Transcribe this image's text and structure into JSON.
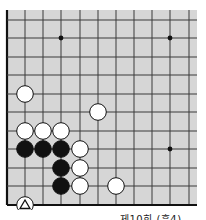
{
  "diagram": {
    "type": "go-board-fragment",
    "colors": {
      "board": "#d6d6d6",
      "line": "#3a3a3a",
      "edge": "#111111",
      "black": "#111111",
      "white": "#ffffff"
    },
    "grid": {
      "cols_x": [
        7,
        25,
        43,
        61,
        80,
        98,
        116,
        134,
        152,
        170,
        189
      ],
      "rows_y": [
        20,
        38,
        57,
        75,
        94,
        112,
        131,
        149,
        168,
        186,
        205
      ],
      "board_rect": {
        "x": 7,
        "y": 10,
        "w": 190,
        "h": 195
      },
      "edges": [
        "left",
        "bottom"
      ]
    },
    "star_points": [
      [
        3,
        1
      ],
      [
        9,
        1
      ],
      [
        9,
        7
      ]
    ],
    "stones": [
      {
        "color": "white",
        "col": 1,
        "row": 4
      },
      {
        "color": "white",
        "col": 5,
        "row": 5
      },
      {
        "color": "white",
        "col": 1,
        "row": 6
      },
      {
        "color": "white",
        "col": 2,
        "row": 6
      },
      {
        "color": "white",
        "col": 3,
        "row": 6
      },
      {
        "color": "black",
        "col": 1,
        "row": 7
      },
      {
        "color": "black",
        "col": 2,
        "row": 7
      },
      {
        "color": "black",
        "col": 3,
        "row": 7
      },
      {
        "color": "white",
        "col": 4,
        "row": 7
      },
      {
        "color": "black",
        "col": 3,
        "row": 8
      },
      {
        "color": "white",
        "col": 4,
        "row": 8
      },
      {
        "color": "black",
        "col": 3,
        "row": 9
      },
      {
        "color": "white",
        "col": 4,
        "row": 9
      },
      {
        "color": "white",
        "col": 6,
        "row": 9
      },
      {
        "color": "white",
        "col": 1,
        "row": 10,
        "mark": "triangle"
      }
    ],
    "caption": "제10회 (흑4)"
  }
}
